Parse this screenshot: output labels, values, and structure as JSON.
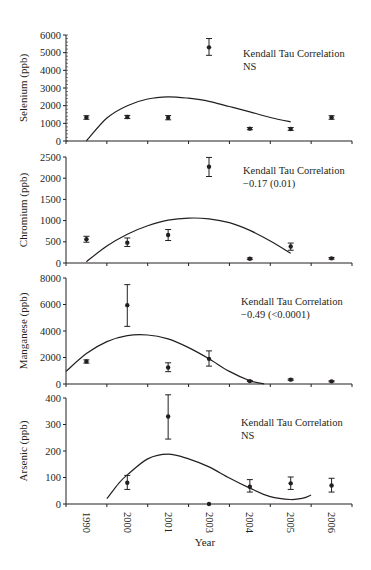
{
  "chart_data": [
    {
      "type": "scatter",
      "title": "",
      "xlabel": "",
      "ylabel": "Selenium (ppb)",
      "ylim": [
        0,
        6000
      ],
      "yticks": [
        0,
        1000,
        2000,
        3000,
        4000,
        5000,
        6000
      ],
      "minor_ticks": true,
      "categories": [
        "1990",
        "2000",
        "2001",
        "2003",
        "2004",
        "2005",
        "2006"
      ],
      "series": [
        {
          "name": "Mean",
          "values": [
            1330,
            1360,
            1320,
            5300,
            700,
            680,
            1330
          ]
        },
        {
          "name": "Error low",
          "values": [
            1230,
            1270,
            1200,
            4850,
            640,
            600,
            1230
          ]
        },
        {
          "name": "Error high",
          "values": [
            1430,
            1450,
            1440,
            5800,
            760,
            760,
            1430
          ]
        }
      ],
      "fit_curve": [
        [
          0,
          0
        ],
        [
          0.5,
          1300
        ],
        [
          1.0,
          2000
        ],
        [
          1.5,
          2380
        ],
        [
          2.0,
          2500
        ],
        [
          2.5,
          2420
        ],
        [
          3.0,
          2250
        ],
        [
          3.5,
          1950
        ],
        [
          4.0,
          1650
        ],
        [
          4.5,
          1330
        ],
        [
          5.0,
          1080
        ]
      ],
      "annotation": [
        "Kendall Tau Correlation",
        "NS"
      ],
      "grid": false
    },
    {
      "type": "scatter",
      "ylabel": "Chromium (ppb)",
      "ylim": [
        0,
        2500
      ],
      "yticks": [
        0,
        500,
        1000,
        1500,
        2000,
        2500
      ],
      "categories": [
        "1990",
        "2000",
        "2001",
        "2003",
        "2004",
        "2005",
        "2006"
      ],
      "series": [
        {
          "name": "Mean",
          "values": [
            560,
            480,
            660,
            2270,
            100,
            390,
            110
          ]
        },
        {
          "name": "Error low",
          "values": [
            490,
            390,
            530,
            2040,
            80,
            300,
            90
          ]
        },
        {
          "name": "Error high",
          "values": [
            630,
            590,
            790,
            2490,
            120,
            470,
            130
          ]
        }
      ],
      "fit_curve": [
        [
          0,
          30
        ],
        [
          0.5,
          400
        ],
        [
          1.0,
          680
        ],
        [
          1.5,
          880
        ],
        [
          2.0,
          1010
        ],
        [
          2.5,
          1060
        ],
        [
          3.0,
          1040
        ],
        [
          3.5,
          950
        ],
        [
          4.0,
          770
        ],
        [
          4.5,
          520
        ],
        [
          5.0,
          230
        ]
      ],
      "annotation": [
        "Kendall Tau Correlation",
        "−0.17 (0.01)"
      ],
      "grid": false
    },
    {
      "type": "scatter",
      "ylabel": "Manganese (ppb)",
      "ylim": [
        0,
        8000
      ],
      "yticks": [
        0,
        2000,
        4000,
        6000,
        8000
      ],
      "categories": [
        "1990",
        "2000",
        "2001",
        "2003",
        "2004",
        "2005",
        "2006"
      ],
      "series": [
        {
          "name": "Mean",
          "values": [
            1700,
            5950,
            1250,
            1900,
            220,
            330,
            200
          ]
        },
        {
          "name": "Error low",
          "values": [
            1580,
            4350,
            930,
            1350,
            180,
            280,
            160
          ]
        },
        {
          "name": "Error high",
          "values": [
            1820,
            7500,
            1600,
            2500,
            260,
            380,
            240
          ]
        }
      ],
      "fit_curve": [
        [
          -0.5,
          950
        ],
        [
          0,
          2300
        ],
        [
          0.5,
          3200
        ],
        [
          1.0,
          3650
        ],
        [
          1.5,
          3700
        ],
        [
          2.0,
          3400
        ],
        [
          2.5,
          2750
        ],
        [
          3.0,
          1900
        ],
        [
          3.5,
          950
        ],
        [
          4.0,
          250
        ],
        [
          4.35,
          0
        ]
      ],
      "annotation": [
        "Kendall Tau Correlation",
        "−0.49 (<0.0001)"
      ],
      "grid": false
    },
    {
      "type": "scatter",
      "ylabel": "Arsenic (ppb)",
      "ylim": [
        0,
        400
      ],
      "yticks": [
        0,
        100,
        200,
        300,
        400
      ],
      "xlabel": "Year",
      "categories": [
        "1990",
        "2000",
        "2001",
        "2003",
        "2004",
        "2005",
        "2006"
      ],
      "series": [
        {
          "name": "Mean",
          "values": [
            null,
            80,
            330,
            0,
            65,
            78,
            70
          ]
        },
        {
          "name": "Error low",
          "values": [
            null,
            55,
            245,
            0,
            45,
            55,
            45
          ]
        },
        {
          "name": "Error high",
          "values": [
            null,
            108,
            412,
            0,
            92,
            102,
            97
          ]
        }
      ],
      "fit_curve": [
        [
          0.5,
          20
        ],
        [
          0.8,
          80
        ],
        [
          1.0,
          110
        ],
        [
          1.5,
          170
        ],
        [
          2.0,
          188
        ],
        [
          2.5,
          170
        ],
        [
          3.0,
          140
        ],
        [
          3.5,
          98
        ],
        [
          4.0,
          60
        ],
        [
          4.5,
          28
        ],
        [
          5.0,
          17
        ],
        [
          5.3,
          22
        ],
        [
          5.5,
          34
        ]
      ],
      "annotation": [
        "Kendall Tau Correlation",
        "NS"
      ],
      "grid": false
    }
  ],
  "x_axis": {
    "title": "Year",
    "labels": [
      "1990",
      "2000",
      "2001",
      "2003",
      "2004",
      "2005",
      "2006"
    ]
  },
  "panels": [
    {
      "id": "selenium",
      "ylabel": "Selenium (ppb)",
      "annotation_line1": "Kendall Tau Correlation",
      "annotation_line2": "NS"
    },
    {
      "id": "chromium",
      "ylabel": "Chromium (ppb)",
      "annotation_line1": "Kendall Tau Correlation",
      "annotation_line2": "−0.17 (0.01)"
    },
    {
      "id": "manganese",
      "ylabel": "Manganese (ppb)",
      "annotation_line1": "Kendall Tau Correlation",
      "annotation_line2": "−0.49 (<0.0001)"
    },
    {
      "id": "arsenic",
      "ylabel": "Arsenic (ppb)",
      "annotation_line1": "Kendall Tau Correlation",
      "annotation_line2": "NS"
    }
  ],
  "colors": {
    "ink": "#231f20",
    "background": "#ffffff"
  }
}
